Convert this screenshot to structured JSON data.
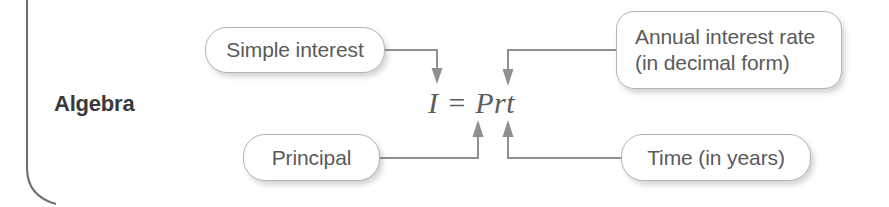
{
  "panel": {
    "section_label": "Algebra",
    "edge_icon": "panel-left-edge-rule"
  },
  "formula": {
    "text": "I = Prt",
    "variables": [
      "I",
      "P",
      "r",
      "t"
    ]
  },
  "callouts": [
    {
      "id": "simple-interest",
      "text": "Simple interest",
      "points_to": "I",
      "arrow": "down"
    },
    {
      "id": "annual-rate",
      "text": "Annual interest rate\n(in decimal form)",
      "line1": "Annual interest rate",
      "line2": "(in decimal form)",
      "points_to": "r",
      "arrow": "down"
    },
    {
      "id": "principal",
      "text": "Principal",
      "points_to": "P",
      "arrow": "up"
    },
    {
      "id": "time",
      "text": "Time (in years)",
      "points_to": "t",
      "arrow": "up"
    }
  ],
  "colors": {
    "box_border": "#b4b4b4",
    "box_fill": "#ffffff",
    "text": "#5a5a5a",
    "label_text": "#3a3a3a",
    "connector": "#8f8f8f",
    "panel_rule": "#6f6f6f"
  }
}
